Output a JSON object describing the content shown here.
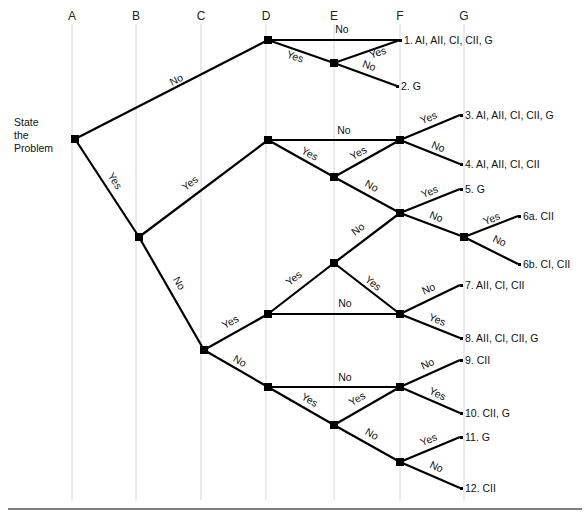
{
  "columns": [
    {
      "label": "A",
      "x": 72
    },
    {
      "label": "B",
      "x": 136
    },
    {
      "label": "C",
      "x": 201
    },
    {
      "label": "D",
      "x": 266
    },
    {
      "label": "E",
      "x": 334
    },
    {
      "label": "F",
      "x": 400
    },
    {
      "label": "G",
      "x": 464
    }
  ],
  "start": {
    "lines": [
      "State",
      "the",
      "Problem"
    ]
  },
  "nodes": [
    {
      "id": "root",
      "x": 75,
      "y": 139
    },
    {
      "id": "d1",
      "x": 268,
      "y": 40
    },
    {
      "id": "e1",
      "x": 334,
      "y": 63
    },
    {
      "id": "b1",
      "x": 139,
      "y": 237
    },
    {
      "id": "d2",
      "x": 268,
      "y": 140
    },
    {
      "id": "e2",
      "x": 334,
      "y": 177
    },
    {
      "id": "f2",
      "x": 400,
      "y": 140
    },
    {
      "id": "f3",
      "x": 400,
      "y": 213
    },
    {
      "id": "g3",
      "x": 464,
      "y": 237
    },
    {
      "id": "c1",
      "x": 204,
      "y": 350
    },
    {
      "id": "d3",
      "x": 268,
      "y": 314
    },
    {
      "id": "e3",
      "x": 334,
      "y": 263
    },
    {
      "id": "f4",
      "x": 400,
      "y": 314
    },
    {
      "id": "d4",
      "x": 268,
      "y": 387
    },
    {
      "id": "e4",
      "x": 334,
      "y": 425
    },
    {
      "id": "f5",
      "x": 400,
      "y": 387
    },
    {
      "id": "f6",
      "x": 400,
      "y": 462
    }
  ],
  "edges": [
    {
      "from": [
        75,
        139
      ],
      "to": [
        268,
        40
      ],
      "label": "No",
      "lx": 178,
      "ly": 83,
      "rot": -27
    },
    {
      "from": [
        268,
        40
      ],
      "to": [
        400,
        40
      ],
      "label": "No",
      "lx": 342,
      "ly": 33,
      "rot": 0
    },
    {
      "from": [
        268,
        40
      ],
      "to": [
        334,
        63
      ],
      "label": "Yes",
      "lx": 294,
      "ly": 60,
      "rot": 19
    },
    {
      "from": [
        334,
        63
      ],
      "to": [
        400,
        40
      ],
      "label": "Yes",
      "lx": 379,
      "ly": 56,
      "rot": -19
    },
    {
      "from": [
        334,
        63
      ],
      "to": [
        397,
        86
      ],
      "label": "No",
      "lx": 368,
      "ly": 69,
      "rot": 19
    },
    {
      "from": [
        75,
        139
      ],
      "to": [
        139,
        237
      ],
      "label": "Yes",
      "lx": 112,
      "ly": 183,
      "rot": 57
    },
    {
      "from": [
        139,
        237
      ],
      "to": [
        268,
        140
      ],
      "label": "Yes",
      "lx": 192,
      "ly": 186,
      "rot": -37
    },
    {
      "from": [
        268,
        140
      ],
      "to": [
        400,
        140
      ],
      "label": "No",
      "lx": 344,
      "ly": 134,
      "rot": 0
    },
    {
      "from": [
        268,
        140
      ],
      "to": [
        334,
        177
      ],
      "label": "Yes",
      "lx": 308,
      "ly": 157,
      "rot": 29
    },
    {
      "from": [
        334,
        177
      ],
      "to": [
        400,
        140
      ],
      "label": "Yes",
      "lx": 360,
      "ly": 156,
      "rot": -29
    },
    {
      "from": [
        400,
        140
      ],
      "to": [
        460,
        115
      ],
      "label": "Yes",
      "lx": 430,
      "ly": 121,
      "rot": -22
    },
    {
      "from": [
        400,
        140
      ],
      "to": [
        460,
        164
      ],
      "label": "No",
      "lx": 437,
      "ly": 150,
      "rot": 22
    },
    {
      "from": [
        334,
        177
      ],
      "to": [
        400,
        213
      ],
      "label": "No",
      "lx": 370,
      "ly": 189,
      "rot": 29
    },
    {
      "from": [
        400,
        213
      ],
      "to": [
        460,
        189
      ],
      "label": "Yes",
      "lx": 431,
      "ly": 195,
      "rot": -22
    },
    {
      "from": [
        400,
        213
      ],
      "to": [
        464,
        237
      ],
      "label": "No",
      "lx": 435,
      "ly": 220,
      "rot": 22
    },
    {
      "from": [
        464,
        237
      ],
      "to": [
        518,
        216
      ],
      "label": "Yes",
      "lx": 493,
      "ly": 222,
      "rot": -22
    },
    {
      "from": [
        464,
        237
      ],
      "to": [
        518,
        264
      ],
      "label": "No",
      "lx": 498,
      "ly": 244,
      "rot": 25
    },
    {
      "from": [
        139,
        237
      ],
      "to": [
        204,
        350
      ],
      "label": "No",
      "lx": 176,
      "ly": 285,
      "rot": 60
    },
    {
      "from": [
        204,
        350
      ],
      "to": [
        268,
        314
      ],
      "label": "Yes",
      "lx": 232,
      "ly": 325,
      "rot": -29
    },
    {
      "from": [
        268,
        314
      ],
      "to": [
        334,
        263
      ],
      "label": "Yes",
      "lx": 296,
      "ly": 281,
      "rot": -38
    },
    {
      "from": [
        334,
        263
      ],
      "to": [
        400,
        213
      ],
      "label": "No",
      "lx": 360,
      "ly": 232,
      "rot": -37
    },
    {
      "from": [
        268,
        314
      ],
      "to": [
        400,
        314
      ],
      "label": "No",
      "lx": 345,
      "ly": 307,
      "rot": 0
    },
    {
      "from": [
        334,
        263
      ],
      "to": [
        400,
        314
      ],
      "label": "Yes",
      "lx": 371,
      "ly": 286,
      "rot": 38
    },
    {
      "from": [
        400,
        314
      ],
      "to": [
        460,
        285
      ],
      "label": "No",
      "lx": 430,
      "ly": 292,
      "rot": -25
    },
    {
      "from": [
        400,
        314
      ],
      "to": [
        460,
        338
      ],
      "label": "Yes",
      "lx": 436,
      "ly": 323,
      "rot": 22
    },
    {
      "from": [
        204,
        350
      ],
      "to": [
        268,
        387
      ],
      "label": "No",
      "lx": 238,
      "ly": 364,
      "rot": 30
    },
    {
      "from": [
        268,
        387
      ],
      "to": [
        400,
        387
      ],
      "label": "No",
      "lx": 345,
      "ly": 381,
      "rot": 0
    },
    {
      "from": [
        268,
        387
      ],
      "to": [
        334,
        425
      ],
      "label": "Yes",
      "lx": 308,
      "ly": 403,
      "rot": 30
    },
    {
      "from": [
        334,
        425
      ],
      "to": [
        400,
        387
      ],
      "label": "Yes",
      "lx": 359,
      "ly": 402,
      "rot": -30
    },
    {
      "from": [
        400,
        387
      ],
      "to": [
        460,
        360
      ],
      "label": "No",
      "lx": 429,
      "ly": 367,
      "rot": -25
    },
    {
      "from": [
        400,
        387
      ],
      "to": [
        460,
        413
      ],
      "label": "Yes",
      "lx": 436,
      "ly": 397,
      "rot": 25
    },
    {
      "from": [
        334,
        425
      ],
      "to": [
        400,
        462
      ],
      "label": "No",
      "lx": 370,
      "ly": 437,
      "rot": 30
    },
    {
      "from": [
        400,
        462
      ],
      "to": [
        460,
        437
      ],
      "label": "Yes",
      "lx": 430,
      "ly": 443,
      "rot": -22
    },
    {
      "from": [
        400,
        462
      ],
      "to": [
        460,
        488
      ],
      "label": "No",
      "lx": 435,
      "ly": 470,
      "rot": 25
    }
  ],
  "leaves": [
    {
      "label": "1. AI, AII, CI, CII, G",
      "x": 404,
      "y": 44
    },
    {
      "label": "2. G",
      "x": 401,
      "y": 90
    },
    {
      "label": "3. AI, AII, CI, CII, G",
      "x": 465,
      "y": 119
    },
    {
      "label": "4. AI, AII, CI, CII",
      "x": 465,
      "y": 168
    },
    {
      "label": "5. G",
      "x": 465,
      "y": 193
    },
    {
      "label": "6a. CII",
      "x": 523,
      "y": 220
    },
    {
      "label": "6b. CI, CII",
      "x": 523,
      "y": 268
    },
    {
      "label": "7. AII, CI, CII",
      "x": 465,
      "y": 289
    },
    {
      "label": "8. AII, CI, CII, G",
      "x": 465,
      "y": 342
    },
    {
      "label": "9. CII",
      "x": 465,
      "y": 364
    },
    {
      "label": "10. CII, G",
      "x": 465,
      "y": 417
    },
    {
      "label": "11. G",
      "x": 465,
      "y": 441
    },
    {
      "label": "12. CII",
      "x": 465,
      "y": 492
    }
  ],
  "footer_rule": {
    "x1": 8,
    "x2": 582,
    "y": 509
  }
}
